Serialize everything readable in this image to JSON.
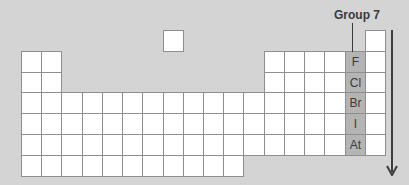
{
  "diagram": {
    "group_label": "Group 7",
    "highlight_group": {
      "name": "Group 7",
      "elements": [
        "F",
        "Cl",
        "Br",
        "I",
        "At"
      ]
    },
    "arrow": {
      "direction": "down",
      "meaning": "going down the group"
    },
    "colors": {
      "background": "#d4d4d4",
      "cell": "#ffffff",
      "cell_border": "#8e8e8e",
      "highlight": "#b4b4b4",
      "text": "#3a3a3a",
      "arrow": "#3e3e3e"
    },
    "grid": {
      "origin_x": 21,
      "origin_y": 30,
      "cell_w": 20.22,
      "cell_h": 20.8,
      "columns": 18,
      "rows": 7
    }
  }
}
